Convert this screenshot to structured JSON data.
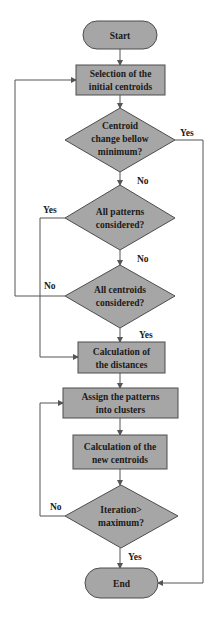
{
  "diagram": {
    "type": "flowchart",
    "nodes": {
      "start": {
        "label": "Start"
      },
      "select_centroids": {
        "line1": "Selection of the",
        "line2": "initial centroids"
      },
      "centroid_change": {
        "line1": "Centroid",
        "line2": "change bellow",
        "line3": "minimum?"
      },
      "all_patterns": {
        "line1": "All patterns",
        "line2": "considered?"
      },
      "all_centroids": {
        "line1": "All centroids",
        "line2": "considered?"
      },
      "calc_distances": {
        "line1": "Calculation of",
        "line2": "the distances"
      },
      "assign_patterns": {
        "line1": "Assign the patterns",
        "line2": "into clusters"
      },
      "calc_new_centroids": {
        "line1": "Calculation of the",
        "line2": "new centroids"
      },
      "iteration_max": {
        "line1": "Iteration>",
        "line2": "maximum?"
      },
      "end": {
        "label": "End"
      }
    },
    "edge_labels": {
      "centroid_change_yes": "Yes",
      "centroid_change_no": "No",
      "all_patterns_yes": "Yes",
      "all_patterns_no": "No",
      "all_centroids_no": "No",
      "all_centroids_yes": "Yes",
      "iteration_no": "No",
      "iteration_yes": "Yes"
    },
    "colors": {
      "shape_fill": "#a6a6a6",
      "shape_stroke": "#4d4d4d",
      "connector": "#555555",
      "text": "#1a1a1a"
    }
  }
}
